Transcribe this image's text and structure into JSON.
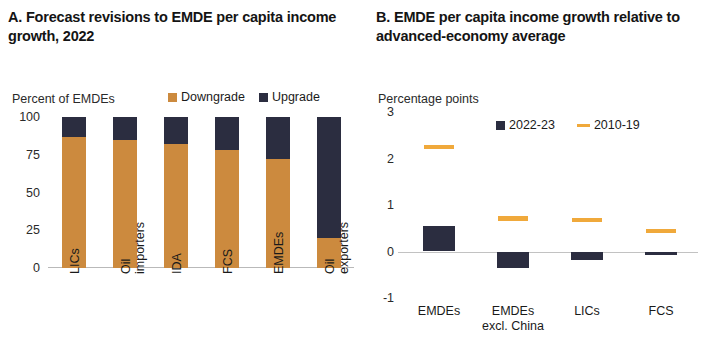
{
  "panel_a": {
    "title": "A. Forecast revisions to EMDE per capita income growth, 2022",
    "axis_unit": "Percent of EMDEs",
    "legend": [
      {
        "label": "Downgrade",
        "color": "#CC8A3E",
        "marker": "square"
      },
      {
        "label": "Upgrade",
        "color": "#2B2D40",
        "marker": "square"
      }
    ],
    "yticks": [
      "100",
      "75",
      "50",
      "25",
      "0"
    ]
  },
  "panel_b": {
    "title": "B. EMDE per capita income growth relative to advanced-economy average",
    "axis_unit": "Percentage points",
    "legend": [
      {
        "label": "2022-23",
        "color": "#2B2D40",
        "marker": "square"
      },
      {
        "label": "2010-19",
        "color": "#F0A93B",
        "marker": "dash"
      }
    ],
    "yticks": [
      "3",
      "2",
      "1",
      "0",
      "-1"
    ]
  },
  "chart_data": [
    {
      "type": "bar",
      "title": "A. Forecast revisions to EMDE per capita income growth, 2022",
      "subtype": "stacked-100",
      "xlabel": "",
      "ylabel": "Percent of EMDEs",
      "ylim": [
        0,
        100
      ],
      "yticks": [
        0,
        25,
        50,
        75,
        100
      ],
      "grid": false,
      "legend_position": "top",
      "categories": [
        "LICs",
        "Oil importers",
        "IDA",
        "FCS",
        "EMDEs",
        "Oil exporters"
      ],
      "category_lines": [
        [
          "LICs"
        ],
        [
          "Oil",
          "importers"
        ],
        [
          "IDA"
        ],
        [
          "FCS"
        ],
        [
          "EMDEs"
        ],
        [
          "Oil",
          "exporters"
        ]
      ],
      "series": [
        {
          "name": "Downgrade",
          "color": "#CC8A3E",
          "values": [
            87,
            85,
            82,
            78,
            72,
            20
          ]
        },
        {
          "name": "Upgrade",
          "color": "#2B2D40",
          "values": [
            13,
            15,
            18,
            22,
            28,
            80
          ]
        }
      ]
    },
    {
      "type": "bar",
      "title": "B. EMDE per capita income growth relative to advanced-economy average",
      "subtype": "bar-with-reference-marks",
      "xlabel": "",
      "ylabel": "Percentage points",
      "ylim": [
        -1,
        3
      ],
      "yticks": [
        -1,
        0,
        1,
        2,
        3
      ],
      "grid": false,
      "legend_position": "top-right",
      "categories": [
        "EMDEs",
        "EMDEs excl. China",
        "LICs",
        "FCS"
      ],
      "category_lines": [
        [
          "EMDEs"
        ],
        [
          "EMDEs",
          "excl. China"
        ],
        [
          "LICs"
        ],
        [
          "FCS"
        ]
      ],
      "series": [
        {
          "name": "2022-23",
          "color": "#2B2D40",
          "marker": "bar",
          "values": [
            0.55,
            -0.35,
            -0.18,
            -0.08
          ]
        },
        {
          "name": "2010-19",
          "color": "#F0A93B",
          "marker": "dash",
          "values": [
            2.25,
            0.72,
            0.68,
            0.45
          ]
        }
      ]
    }
  ]
}
